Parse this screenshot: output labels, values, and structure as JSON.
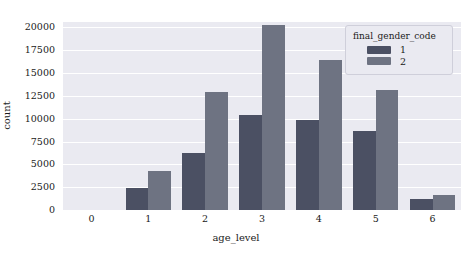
{
  "chart_data": {
    "type": "bar",
    "title": "",
    "xlabel": "age_level",
    "ylabel": "count",
    "categories": [
      "0",
      "1",
      "2",
      "3",
      "4",
      "5",
      "6"
    ],
    "series": [
      {
        "name": "1",
        "color": "#4b5063",
        "values": [
          0,
          2400,
          6200,
          10400,
          9900,
          8700,
          1200
        ]
      },
      {
        "name": "2",
        "color": "#6e7382",
        "values": [
          0,
          4300,
          12900,
          20300,
          16400,
          13100,
          1600
        ]
      }
    ],
    "ylim": [
      0,
      20600
    ],
    "yticks": [
      0,
      2500,
      5000,
      7500,
      10000,
      12500,
      15000,
      17500,
      20000
    ],
    "ytick_labels": [
      "0",
      "2500",
      "5000",
      "7500",
      "10000",
      "12500",
      "15000",
      "17500",
      "20000"
    ],
    "grid": true,
    "grid_axis": "y",
    "legend": {
      "title": "final_gender_code",
      "position": "upper right",
      "entries": [
        {
          "label": "1",
          "color": "#4b5063"
        },
        {
          "label": "2",
          "color": "#6e7382"
        }
      ]
    },
    "style": {
      "plot_background": "#eaeaf1",
      "figure_background": "#ffffff",
      "gridline_color": "#ffffff"
    }
  }
}
